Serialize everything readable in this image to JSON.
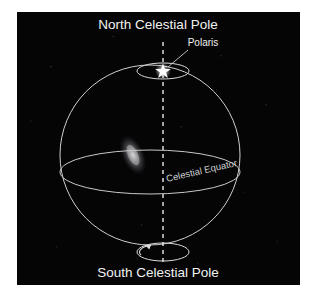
{
  "figure": {
    "kind": "celestial-sphere-diagram",
    "page_background": "#ffffff",
    "panel_background": "#050506",
    "line_color": "#d8d8d8",
    "text_color": "#f2f2f2",
    "axis_style": "dashed"
  },
  "labels": {
    "north_pole": "North Celestial Pole",
    "polaris": "Polaris",
    "celestial_equator": "Celestial Equator",
    "south_pole": "South Celestial Pole"
  },
  "icons": {
    "star": "star-icon",
    "rotation_arrow": "rotation-arrow-icon",
    "galaxy": "galaxy-smudge-icon",
    "leader_line": "leader-line-icon"
  },
  "geometry": {
    "sphere_center_x": 150,
    "sphere_center_y": 155,
    "sphere_radius": 90,
    "axis_x": 163,
    "axis_top_y": 42,
    "axis_bottom_y": 262,
    "equator_rx": 90,
    "equator_ry": 22,
    "equator_cy": 172,
    "north_ellipse_cx": 163,
    "north_ellipse_cy": 71,
    "north_ellipse_rx": 26,
    "north_ellipse_ry": 8,
    "south_ellipse_cx": 163,
    "south_ellipse_cy": 252,
    "south_ellipse_rx": 26,
    "south_ellipse_ry": 9,
    "equator_label_rotation_deg": -13
  }
}
